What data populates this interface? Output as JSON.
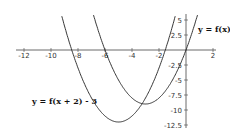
{
  "chart_data": {
    "type": "line",
    "title": "",
    "xlabel": "",
    "ylabel": "",
    "xlim": [
      -12,
      2
    ],
    "ylim": [
      -12.5,
      5
    ],
    "grid": false,
    "x_ticks": [
      "-12",
      "-10",
      "-8",
      "-6",
      "-4",
      "-2",
      "2"
    ],
    "y_ticks": [
      "5",
      "2.5",
      "-2.5",
      "-5",
      "-7.5",
      "-10",
      "-12.5"
    ],
    "series": [
      {
        "name": "y = f(x)",
        "formula": "x^2 + 6x",
        "vertex": [
          -3,
          -9
        ],
        "roots": [
          -6,
          0
        ]
      },
      {
        "name": "y = f(x + 2) - 3",
        "formula": "x^2 + 10x + 13",
        "vertex": [
          -5,
          -12
        ],
        "roots": [
          -8.46,
          -1.54
        ]
      }
    ],
    "annotations": [
      "y = f(x)",
      "y = f(x + 2) - 3"
    ]
  }
}
